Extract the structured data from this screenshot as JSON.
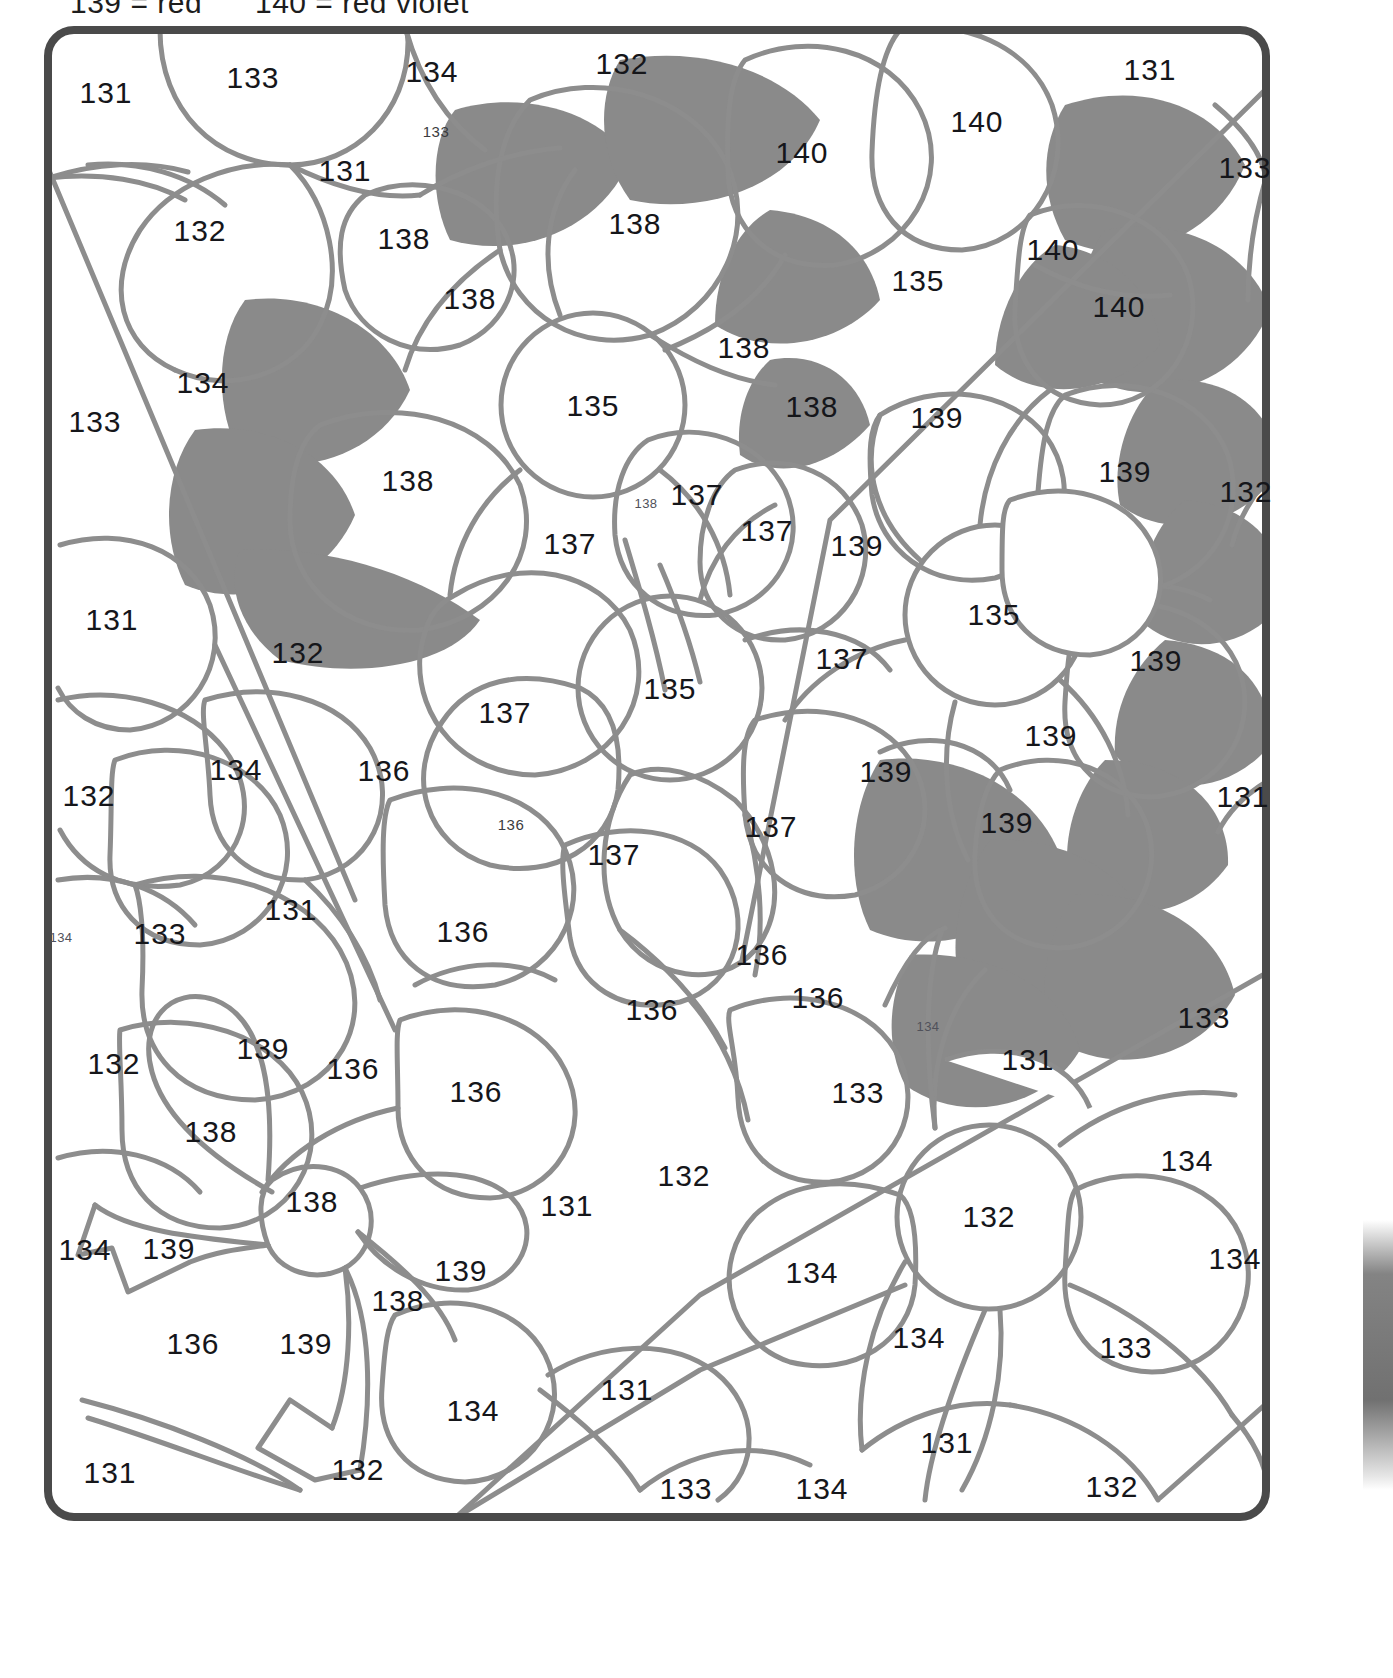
{
  "legend": {
    "items": [
      "139 = red",
      "140 = red violet"
    ]
  },
  "artwork": {
    "title": "color-by-number flower bouquet",
    "border_color": "#4a4a4a",
    "line_color": "#8d8d8d",
    "shade_color": "#8a8a8a",
    "background_color": "#ffffff"
  },
  "regions": [
    {
      "n": "131",
      "x": 106,
      "y": 93,
      "size": "lg"
    },
    {
      "n": "133",
      "x": 253,
      "y": 78,
      "size": "lg"
    },
    {
      "n": "134",
      "x": 432,
      "y": 72,
      "size": "lg"
    },
    {
      "n": "132",
      "x": 622,
      "y": 64,
      "size": "lg"
    },
    {
      "n": "131",
      "x": 1150,
      "y": 70,
      "size": "lg"
    },
    {
      "n": "133",
      "x": 436,
      "y": 131,
      "size": "sm"
    },
    {
      "n": "131",
      "x": 345,
      "y": 171,
      "size": "lg"
    },
    {
      "n": "140",
      "x": 802,
      "y": 153,
      "size": "lg"
    },
    {
      "n": "140",
      "x": 977,
      "y": 122,
      "size": "lg"
    },
    {
      "n": "133",
      "x": 1245,
      "y": 168,
      "size": "lg"
    },
    {
      "n": "132",
      "x": 200,
      "y": 231,
      "size": "lg"
    },
    {
      "n": "138",
      "x": 404,
      "y": 239,
      "size": "lg"
    },
    {
      "n": "138",
      "x": 635,
      "y": 224,
      "size": "lg"
    },
    {
      "n": "140",
      "x": 1053,
      "y": 250,
      "size": "lg"
    },
    {
      "n": "135",
      "x": 918,
      "y": 281,
      "size": "lg"
    },
    {
      "n": "138",
      "x": 470,
      "y": 299,
      "size": "lg"
    },
    {
      "n": "140",
      "x": 1119,
      "y": 307,
      "size": "lg"
    },
    {
      "n": "138",
      "x": 744,
      "y": 348,
      "size": "lg"
    },
    {
      "n": "134",
      "x": 203,
      "y": 383,
      "size": "lg"
    },
    {
      "n": "135",
      "x": 593,
      "y": 406,
      "size": "lg"
    },
    {
      "n": "138",
      "x": 812,
      "y": 407,
      "size": "lg"
    },
    {
      "n": "139",
      "x": 937,
      "y": 418,
      "size": "lg"
    },
    {
      "n": "133",
      "x": 95,
      "y": 422,
      "size": "lg"
    },
    {
      "n": "138",
      "x": 408,
      "y": 481,
      "size": "lg"
    },
    {
      "n": "139",
      "x": 1125,
      "y": 472,
      "size": "lg"
    },
    {
      "n": "132",
      "x": 1246,
      "y": 492,
      "size": "lg"
    },
    {
      "n": "138",
      "x": 646,
      "y": 503,
      "size": "xs"
    },
    {
      "n": "137",
      "x": 697,
      "y": 495,
      "size": "lg"
    },
    {
      "n": "137",
      "x": 767,
      "y": 531,
      "size": "lg"
    },
    {
      "n": "137",
      "x": 570,
      "y": 544,
      "size": "lg"
    },
    {
      "n": "139",
      "x": 857,
      "y": 546,
      "size": "lg"
    },
    {
      "n": "131",
      "x": 112,
      "y": 620,
      "size": "lg"
    },
    {
      "n": "135",
      "x": 994,
      "y": 615,
      "size": "lg"
    },
    {
      "n": "132",
      "x": 298,
      "y": 653,
      "size": "lg"
    },
    {
      "n": "137",
      "x": 842,
      "y": 659,
      "size": "lg"
    },
    {
      "n": "139",
      "x": 1156,
      "y": 661,
      "size": "lg"
    },
    {
      "n": "135",
      "x": 670,
      "y": 689,
      "size": "lg"
    },
    {
      "n": "137",
      "x": 505,
      "y": 713,
      "size": "lg"
    },
    {
      "n": "139",
      "x": 1051,
      "y": 736,
      "size": "lg"
    },
    {
      "n": "134",
      "x": 236,
      "y": 770,
      "size": "lg"
    },
    {
      "n": "136",
      "x": 384,
      "y": 771,
      "size": "lg"
    },
    {
      "n": "139",
      "x": 886,
      "y": 772,
      "size": "lg"
    },
    {
      "n": "132",
      "x": 89,
      "y": 796,
      "size": "lg"
    },
    {
      "n": "131",
      "x": 1243,
      "y": 797,
      "size": "lg"
    },
    {
      "n": "136",
      "x": 511,
      "y": 824,
      "size": "sm"
    },
    {
      "n": "137",
      "x": 771,
      "y": 827,
      "size": "lg"
    },
    {
      "n": "139",
      "x": 1007,
      "y": 823,
      "size": "lg"
    },
    {
      "n": "137",
      "x": 614,
      "y": 855,
      "size": "lg"
    },
    {
      "n": "131",
      "x": 291,
      "y": 910,
      "size": "lg"
    },
    {
      "n": "133",
      "x": 160,
      "y": 934,
      "size": "lg"
    },
    {
      "n": "136",
      "x": 463,
      "y": 932,
      "size": "lg"
    },
    {
      "n": "134",
      "x": 61,
      "y": 937,
      "size": "xs"
    },
    {
      "n": "136",
      "x": 762,
      "y": 955,
      "size": "lg"
    },
    {
      "n": "136",
      "x": 652,
      "y": 1010,
      "size": "lg"
    },
    {
      "n": "136",
      "x": 818,
      "y": 998,
      "size": "lg"
    },
    {
      "n": "133",
      "x": 1204,
      "y": 1018,
      "size": "lg"
    },
    {
      "n": "134",
      "x": 928,
      "y": 1026,
      "size": "xs"
    },
    {
      "n": "139",
      "x": 263,
      "y": 1049,
      "size": "lg"
    },
    {
      "n": "132",
      "x": 114,
      "y": 1064,
      "size": "lg"
    },
    {
      "n": "136",
      "x": 353,
      "y": 1069,
      "size": "lg"
    },
    {
      "n": "131",
      "x": 1028,
      "y": 1060,
      "size": "lg"
    },
    {
      "n": "133",
      "x": 858,
      "y": 1093,
      "size": "lg"
    },
    {
      "n": "136",
      "x": 476,
      "y": 1092,
      "size": "lg"
    },
    {
      "n": "138",
      "x": 211,
      "y": 1132,
      "size": "lg"
    },
    {
      "n": "134",
      "x": 1187,
      "y": 1161,
      "size": "lg"
    },
    {
      "n": "132",
      "x": 684,
      "y": 1176,
      "size": "lg"
    },
    {
      "n": "138",
      "x": 312,
      "y": 1202,
      "size": "lg"
    },
    {
      "n": "131",
      "x": 567,
      "y": 1206,
      "size": "lg"
    },
    {
      "n": "132",
      "x": 989,
      "y": 1217,
      "size": "lg"
    },
    {
      "n": "134",
      "x": 85,
      "y": 1250,
      "size": "lg"
    },
    {
      "n": "139",
      "x": 169,
      "y": 1249,
      "size": "lg"
    },
    {
      "n": "139",
      "x": 461,
      "y": 1271,
      "size": "lg"
    },
    {
      "n": "134",
      "x": 1235,
      "y": 1259,
      "size": "lg"
    },
    {
      "n": "134",
      "x": 812,
      "y": 1273,
      "size": "lg"
    },
    {
      "n": "138",
      "x": 398,
      "y": 1301,
      "size": "lg"
    },
    {
      "n": "134",
      "x": 919,
      "y": 1338,
      "size": "lg"
    },
    {
      "n": "136",
      "x": 193,
      "y": 1344,
      "size": "lg"
    },
    {
      "n": "139",
      "x": 306,
      "y": 1344,
      "size": "lg"
    },
    {
      "n": "133",
      "x": 1126,
      "y": 1348,
      "size": "lg"
    },
    {
      "n": "131",
      "x": 627,
      "y": 1390,
      "size": "lg"
    },
    {
      "n": "134",
      "x": 473,
      "y": 1411,
      "size": "lg"
    },
    {
      "n": "131",
      "x": 947,
      "y": 1443,
      "size": "lg"
    },
    {
      "n": "131",
      "x": 110,
      "y": 1473,
      "size": "lg"
    },
    {
      "n": "132",
      "x": 358,
      "y": 1470,
      "size": "lg"
    },
    {
      "n": "133",
      "x": 686,
      "y": 1489,
      "size": "lg"
    },
    {
      "n": "134",
      "x": 822,
      "y": 1489,
      "size": "lg"
    },
    {
      "n": "132",
      "x": 1112,
      "y": 1487,
      "size": "lg"
    }
  ]
}
